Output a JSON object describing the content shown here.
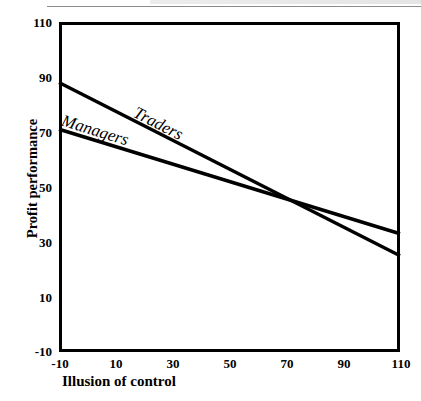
{
  "figure": {
    "page_rule": "",
    "plot_frame": "plot-frame"
  },
  "chart_data": {
    "type": "line",
    "title": "",
    "xlabel": "Illusion of control",
    "ylabel": "Profit performance",
    "xlim": [
      -10,
      110
    ],
    "ylim": [
      -10,
      110
    ],
    "xticks": [
      -10,
      10,
      30,
      50,
      70,
      90,
      110
    ],
    "yticks": [
      -10,
      10,
      30,
      50,
      70,
      90,
      110
    ],
    "xtick_labels": [
      "-10",
      "10",
      "30",
      "50",
      "70",
      "90",
      "110"
    ],
    "ytick_labels": [
      "-10",
      "10",
      "30",
      "50",
      "70",
      "90",
      "110"
    ],
    "grid": false,
    "legend": "inline-labels",
    "line_color": "#000000",
    "series": [
      {
        "name": "Traders",
        "x": [
          -10,
          110
        ],
        "values": [
          88,
          25
        ]
      },
      {
        "name": "Managers",
        "x": [
          -10,
          110
        ],
        "values": [
          71,
          33
        ]
      }
    ],
    "annotations": [
      {
        "text": "Traders",
        "x": 20,
        "y": 78
      },
      {
        "text": "Managers",
        "x": -6,
        "y": 68
      }
    ]
  }
}
